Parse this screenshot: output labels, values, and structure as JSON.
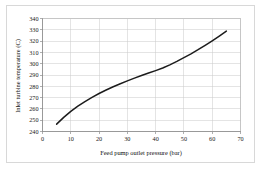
{
  "chart_data": {
    "type": "line",
    "title": "",
    "xlabel": "Feed pump outlet pressure (bar)",
    "ylabel": "Inlet turbine temperature (C)",
    "xlim": [
      0,
      70
    ],
    "ylim": [
      240,
      340
    ],
    "xticks": [
      "0",
      "10",
      "20",
      "30",
      "40",
      "50",
      "60",
      "70"
    ],
    "yticks": [
      "240",
      "250",
      "260",
      "270",
      "280",
      "290",
      "300",
      "310",
      "320",
      "330",
      "340"
    ],
    "xtick_values": [
      0,
      10,
      20,
      30,
      40,
      50,
      60,
      70
    ],
    "ytick_values": [
      240,
      250,
      260,
      270,
      280,
      290,
      300,
      310,
      320,
      330,
      340
    ],
    "grid": true,
    "grid_color": "#c9c9c9",
    "legend": null,
    "series": [
      {
        "name": "Inlet turbine temperature",
        "color": "#1c1c1c",
        "x": [
          5,
          7.5,
          10,
          12.5,
          15,
          17.5,
          20,
          22.5,
          25,
          27.5,
          30,
          32.5,
          35,
          37.5,
          40,
          42.5,
          45,
          47.5,
          50,
          52.5,
          55,
          57.5,
          60,
          62.5,
          65
        ],
        "y": [
          246.5,
          252.5,
          257.8,
          262.5,
          266.5,
          270.2,
          273.6,
          276.7,
          279.6,
          282.3,
          284.8,
          287.2,
          289.5,
          291.7,
          293.9,
          296.2,
          299.0,
          302.0,
          305.3,
          308.7,
          312.4,
          316.3,
          320.3,
          324.5,
          328.8
        ]
      }
    ]
  },
  "figure": {
    "background_color": "#ffffff",
    "border_color": "#d8d8d8",
    "axis_color": "#8d8d8d"
  }
}
